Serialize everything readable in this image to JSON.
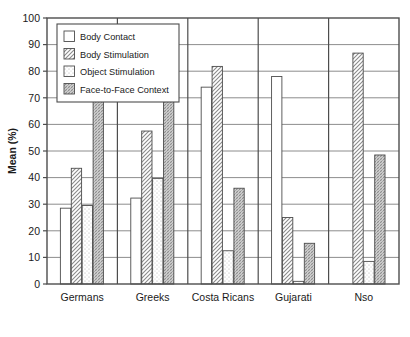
{
  "chart_data": {
    "type": "bar",
    "title": "",
    "xlabel": "",
    "ylabel": "Mean (%)",
    "ylim": [
      0,
      100
    ],
    "ytick_step": 10,
    "yticks": [
      0,
      10,
      20,
      30,
      40,
      50,
      60,
      70,
      80,
      90,
      100
    ],
    "grid": true,
    "legend_position": "top-left",
    "categories": [
      "Germans",
      "Greeks",
      "Costa Ricans",
      "Gujarati",
      "Nso"
    ],
    "series": [
      {
        "name": "Body Contact",
        "pattern": "empty",
        "values": [
          28.5,
          32.3,
          74.0,
          78.0,
          0
        ]
      },
      {
        "name": "Body Stimulation",
        "pattern": "diagonal-hatch",
        "values": [
          43.5,
          57.5,
          81.8,
          25.0,
          86.8
        ]
      },
      {
        "name": "Object Stimulation",
        "pattern": "dots",
        "values": [
          29.5,
          39.7,
          12.5,
          1.0,
          8.5
        ]
      },
      {
        "name": "Face-to-Face Context",
        "pattern": "cross-hatch",
        "values": [
          69.5,
          70.3,
          36.0,
          15.3,
          48.5
        ]
      }
    ]
  },
  "axis": {
    "y_title": "Mean (%)",
    "tick_labels": [
      "0",
      "10",
      "20",
      "30",
      "40",
      "50",
      "60",
      "70",
      "80",
      "90",
      "100"
    ]
  },
  "legend": {
    "items": [
      {
        "label": "Body Contact"
      },
      {
        "label": "Body Stimulation"
      },
      {
        "label": "Object Stimulation"
      },
      {
        "label": "Face-to-Face Context"
      }
    ]
  },
  "colors": {
    "axis": "#4d4d4d",
    "grid": "#808080",
    "bar_outline": "#4d4d4d",
    "bar_fill": "#ffffff",
    "hatch": "#8a8a8a",
    "text": "#1a1a1a",
    "background": "#ffffff"
  }
}
